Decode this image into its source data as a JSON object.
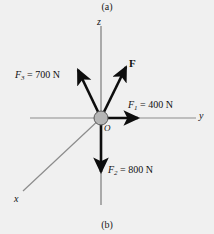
{
  "figure": {
    "caption_top": "(a)",
    "caption_bottom": "(b)",
    "background_color": "#f0f0f0",
    "axis_color": "#8c8c8c",
    "vector_color": "#0d0d0d",
    "node_fill": "#b5b5b5",
    "node_stroke": "#5a5a5a"
  },
  "axes": {
    "z_label": "z",
    "y_label": "y",
    "x_label": "x",
    "origin_label": "O"
  },
  "forces": [
    {
      "name": "F3",
      "symbol": "F",
      "subscript": "3",
      "equals": " = ",
      "magnitude": "700",
      "unit": "N",
      "label": "F3 = 700 N",
      "direction": "up-left"
    },
    {
      "name": "F1",
      "symbol": "F",
      "subscript": "1",
      "equals": " = ",
      "magnitude": "400",
      "unit": "N",
      "label": "F1 = 400 N",
      "direction": "right"
    },
    {
      "name": "F2",
      "symbol": "F",
      "subscript": "2",
      "equals": " = ",
      "magnitude": "800",
      "unit": "N",
      "label": "F2 = 800 N",
      "direction": "down"
    }
  ],
  "resultant": {
    "name": "F",
    "label": "F",
    "direction": "up-right"
  }
}
